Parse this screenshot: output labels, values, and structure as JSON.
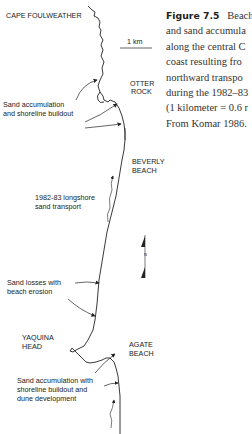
{
  "caption": {
    "figure_label": "Figure 7.5",
    "lines": [
      "Beach",
      "and sand accumula",
      "along the central C",
      "coast resulting fro",
      "northward transpo",
      "during the 1982–83",
      "(1 kilometer = 0.6 r",
      "From Komar 1986."
    ]
  },
  "map": {
    "places": {
      "cape_foulweather": "CAPE FOULWEATHER",
      "otter_rock_1": "OTTER",
      "otter_rock_2": "ROCK",
      "beverly_beach_1": "BEVERLY",
      "beverly_beach_2": "BEACH",
      "yaquina_head_1": "YAQUINA",
      "yaquina_head_2": "HEAD",
      "agate_beach_1": "AGATE",
      "agate_beach_2": "BEACH"
    },
    "annotations": {
      "accum_1": "Sand accumulation",
      "accum_2": "and shoreline buildout",
      "transport_1": "1982-83 longshore",
      "transport_2": "sand transport",
      "loss_1": "Sand losses with",
      "loss_2": "beach erosion",
      "dune_1": "Sand accumulation with",
      "dune_2": "shoreline buildout and",
      "dune_3": "dune development"
    },
    "scale_bar": "1 km",
    "north_label": "N"
  }
}
